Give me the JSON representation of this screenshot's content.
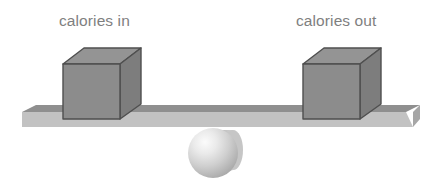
{
  "diagram": {
    "type": "balance-scale-illustration",
    "background_color": "#ffffff"
  },
  "labels": {
    "left": "calories in",
    "right": "calories out",
    "text_color": "#7f7f7f"
  },
  "blocks": {
    "left": {
      "name": "calories in",
      "shape": "cube",
      "front_color": "#8c8c8c",
      "top_color": "#949494",
      "side_color": "#7d7d7d",
      "edge_color": "#4d4d4d"
    },
    "right": {
      "name": "calories out",
      "shape": "cube",
      "front_color": "#8c8c8c",
      "top_color": "#949494",
      "side_color": "#7d7d7d",
      "edge_color": "#4d4d4d"
    }
  },
  "beam": {
    "name": "balance beam",
    "state": "level",
    "top_color": "#8f8f8f",
    "front_color": "#c2c2c2",
    "end_color": "#adadad"
  },
  "fulcrum": {
    "name": "sphere fulcrum",
    "shape": "sphere",
    "highlight_color": "#f2f2f2",
    "base_color": "#b5b5b5",
    "shadow_color": "#bdbdbd"
  }
}
